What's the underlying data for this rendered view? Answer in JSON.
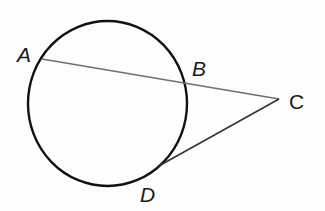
{
  "diagram": {
    "type": "geometry",
    "colors": {
      "circle": "#111111",
      "secant": "#6f6f6f",
      "tangent": "#333333",
      "label": "#1a1a1a"
    },
    "circle": {
      "cx": 107.5,
      "cy": 103.5,
      "rx": 79.5,
      "ry": 82.5
    },
    "points": {
      "A": {
        "label": "A",
        "x": 42,
        "y": 59
      },
      "B": {
        "label": "B",
        "x": 185,
        "y": 84
      },
      "C": {
        "label": "C",
        "x": 279,
        "y": 99
      },
      "D": {
        "label": "D",
        "x": 157,
        "y": 167
      }
    },
    "segments": [
      {
        "name": "secant-AC",
        "from": "A",
        "to": "C"
      },
      {
        "name": "tangent-CD",
        "from": "C",
        "to": "D"
      }
    ]
  }
}
